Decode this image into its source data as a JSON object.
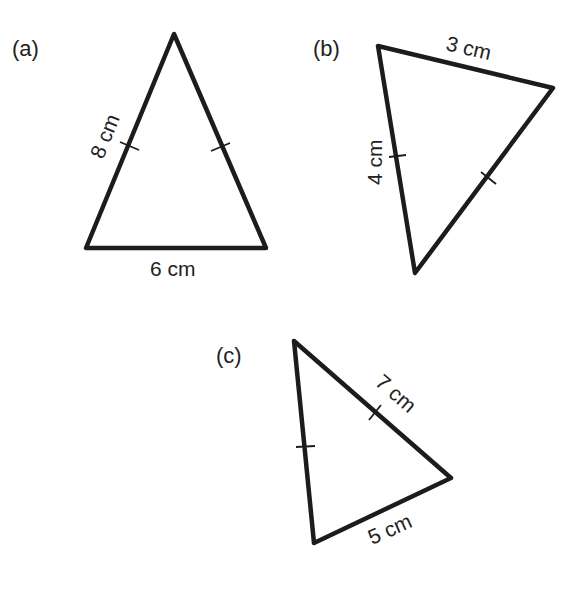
{
  "colors": {
    "line": "#1c1c1c",
    "text": "#222222",
    "background": "#ffffff"
  },
  "figures": [
    {
      "id": "a",
      "label": "(a)",
      "vertices": [
        [
          174,
          34
        ],
        [
          86,
          248
        ],
        [
          266,
          248
        ]
      ],
      "sides": [
        {
          "label": "8 cm",
          "equal_tick": true
        },
        {
          "label": "",
          "equal_tick": true
        },
        {
          "label": "6 cm",
          "equal_tick": false
        }
      ]
    },
    {
      "id": "b",
      "label": "(b)",
      "vertices": [
        [
          378,
          46
        ],
        [
          553,
          88
        ],
        [
          415,
          273
        ]
      ],
      "sides": [
        {
          "label": "3 cm",
          "equal_tick": false
        },
        {
          "label": "",
          "equal_tick": true
        },
        {
          "label": "4 cm",
          "equal_tick": true
        }
      ]
    },
    {
      "id": "c",
      "label": "(c)",
      "vertices": [
        [
          294,
          341
        ],
        [
          451,
          478
        ],
        [
          314,
          543
        ]
      ],
      "sides": [
        {
          "label": "7 cm",
          "equal_tick": true
        },
        {
          "label": "5 cm",
          "equal_tick": false
        },
        {
          "label": "",
          "equal_tick": true
        }
      ]
    }
  ]
}
